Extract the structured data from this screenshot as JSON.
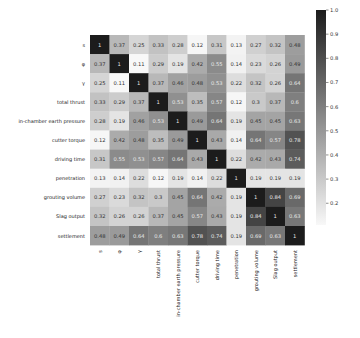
{
  "chart_data": {
    "type": "heatmap",
    "title": "",
    "xlabel": "",
    "ylabel": "",
    "labels": [
      "s",
      "φ",
      "γ",
      "total thrust",
      "in-chamber earth pressure",
      "cutter torque",
      "driving time",
      "penetration",
      "grouting volume",
      "Slag output",
      "settlement"
    ],
    "matrix": [
      [
        1,
        0.37,
        0.25,
        0.33,
        0.28,
        0.12,
        0.31,
        0.13,
        0.27,
        0.32,
        0.48
      ],
      [
        0.37,
        1,
        0.11,
        0.29,
        0.19,
        0.42,
        0.55,
        0.14,
        0.23,
        0.26,
        0.49
      ],
      [
        0.25,
        0.11,
        1,
        0.37,
        0.46,
        0.48,
        0.53,
        0.22,
        0.32,
        0.26,
        0.64
      ],
      [
        0.33,
        0.29,
        0.37,
        1,
        0.53,
        0.35,
        0.57,
        0.12,
        0.3,
        0.37,
        0.6
      ],
      [
        0.28,
        0.19,
        0.46,
        0.53,
        1,
        0.49,
        0.64,
        0.19,
        0.45,
        0.45,
        0.63
      ],
      [
        0.12,
        0.42,
        0.48,
        0.35,
        0.49,
        1,
        0.43,
        0.14,
        0.64,
        0.57,
        0.78
      ],
      [
        0.31,
        0.55,
        0.53,
        0.57,
        0.64,
        0.43,
        1,
        0.22,
        0.42,
        0.43,
        0.74
      ],
      [
        0.13,
        0.14,
        0.22,
        0.12,
        0.19,
        0.14,
        0.22,
        1,
        0.19,
        0.19,
        0.19
      ],
      [
        0.27,
        0.23,
        0.32,
        0.3,
        0.45,
        0.64,
        0.42,
        0.19,
        1,
        0.84,
        0.69
      ],
      [
        0.32,
        0.26,
        0.26,
        0.37,
        0.45,
        0.57,
        0.43,
        0.19,
        0.84,
        1,
        0.63
      ],
      [
        0.48,
        0.49,
        0.64,
        0.6,
        0.63,
        0.78,
        0.74,
        0.19,
        0.69,
        0.63,
        1
      ]
    ],
    "colorbar": {
      "min": 0.11,
      "max": 1.0,
      "ticks": [
        1.0,
        0.9,
        0.8,
        0.7,
        0.6,
        0.5,
        0.4,
        0.3,
        0.2
      ],
      "colormap": "Greys"
    },
    "grid": false,
    "legend_position": "right"
  }
}
